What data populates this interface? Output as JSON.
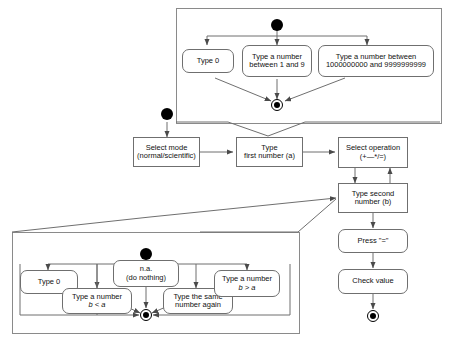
{
  "diagram": {
    "type": "uml-activity-diagram",
    "groups": {
      "first_number": {
        "label": "first-number-alternatives-frame"
      },
      "second_number": {
        "label": "second-number-alternatives-frame"
      }
    },
    "nodes": {
      "a1_type0": {
        "l1": "Type 0",
        "l2": ""
      },
      "a2_1to9": {
        "l1": "Type a number",
        "l2": "between 1 and 9"
      },
      "a3_bignum": {
        "l1": "Type a number between",
        "l2": "1000000000 and 9999999999"
      },
      "select_mode": {
        "l1": "Select mode",
        "l2": "(normal/scientific)"
      },
      "first_number": {
        "l1": "Type",
        "l2": "first number (a)"
      },
      "select_op": {
        "l1": "Select operation",
        "l2": "(+—*/=)"
      },
      "second_number": {
        "l1": "Type second",
        "l2": "number (b)"
      },
      "press_equals": {
        "l1": "Press \"=\"",
        "l2": ""
      },
      "check_value": {
        "l1": "Check value",
        "l2": ""
      },
      "b1_type0": {
        "l1": "Type 0",
        "l2": ""
      },
      "b2_blta": {
        "l1": "Type a number",
        "l2": "b < a"
      },
      "b3_na": {
        "l1": "n.a.",
        "l2": "(do nothing)"
      },
      "b4_same": {
        "l1": "Type the same",
        "l2": "number again"
      },
      "b5_bgta": {
        "l1": "Type a number",
        "l2": "b > a"
      }
    },
    "markers": {
      "initial_main": "initial-state-node",
      "initial_top": "initial-state-node",
      "initial_bottom": "initial-state-node",
      "final_top": "final-state-node",
      "final_bottom": "final-state-node",
      "final_main": "final-state-node"
    },
    "colors": {
      "line": "#6f6f6f",
      "frame": "#8a8a8a",
      "ink": "#111111"
    }
  }
}
